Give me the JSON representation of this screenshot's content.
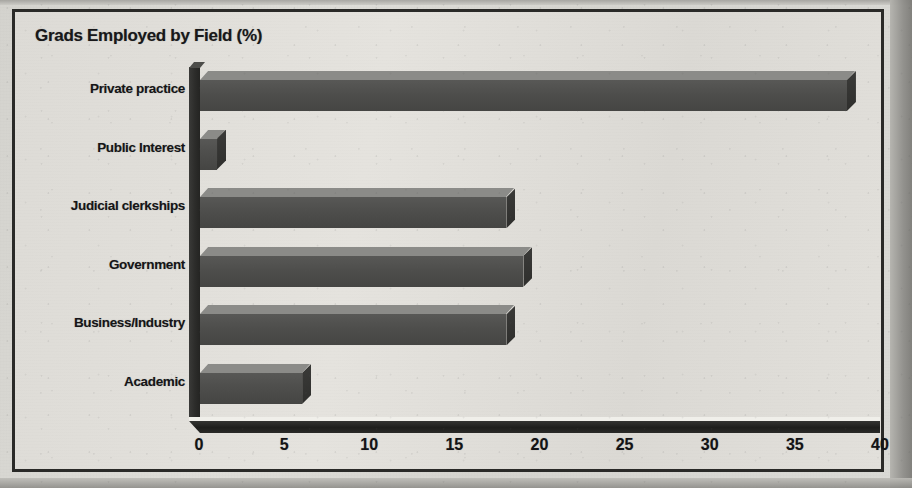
{
  "figure": {
    "title": "Grads Employed by Field (%)",
    "frame_color": "#2a2a28",
    "page_background": "#dedcd7"
  },
  "chart_data": {
    "type": "bar",
    "orientation": "horizontal",
    "title": "Grads Employed by Field (%)",
    "xlabel": "",
    "ylabel": "",
    "categories": [
      "Private practice",
      "Public Interest",
      "Judicial clerkships",
      "Government",
      "Business/Industry",
      "Academic"
    ],
    "values": [
      38,
      1,
      18,
      19,
      18,
      6
    ],
    "xlim": [
      0,
      40
    ],
    "xticks": [
      0,
      5,
      10,
      15,
      20,
      25,
      30,
      35,
      40
    ],
    "xtick_labels": [
      "0",
      "5",
      "10",
      "15",
      "20",
      "25",
      "30",
      "35",
      "40"
    ],
    "grid": false,
    "legend": null,
    "bar_style": "3d-shaded",
    "bar_front_color": "#4e4e4c",
    "bar_top_color": "#8b8b88",
    "bar_side_color": "#33332f",
    "axis_color": "#1e1e1c"
  }
}
